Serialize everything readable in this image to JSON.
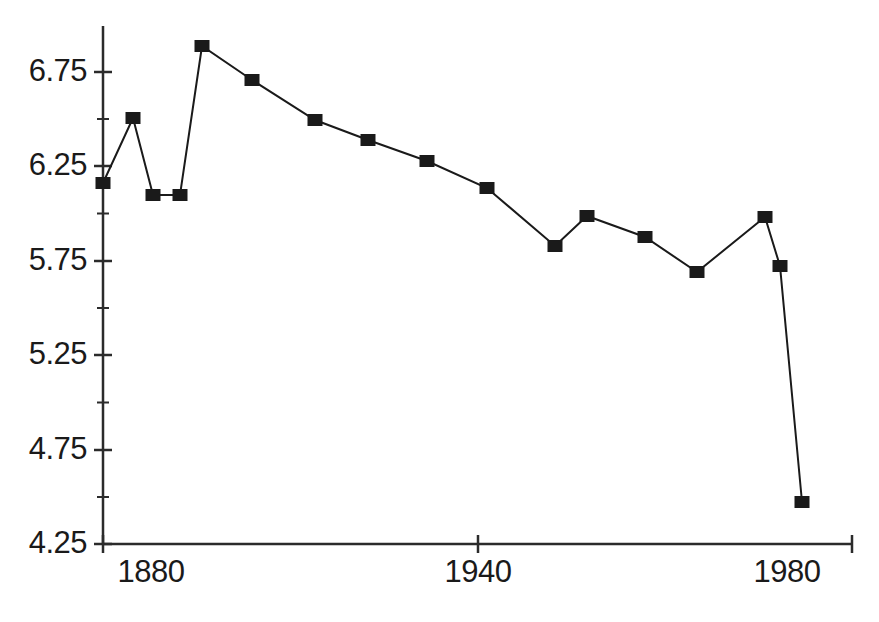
{
  "chart_data": {
    "type": "line",
    "title": "",
    "subtitle": "",
    "xlabel": "",
    "ylabel": "",
    "grid": false,
    "legend": null,
    "marker": "filled-square",
    "line_color": "#1a1a1a",
    "marker_color": "#1a1a1a",
    "background": "#ffffff",
    "xlim": [
      1872,
      1985
    ],
    "ylim": [
      4.25,
      6.95
    ],
    "y_ticks_major": [
      4.25,
      4.75,
      5.25,
      5.75,
      6.25,
      6.75
    ],
    "y_ticks_minor": [
      4.5,
      5.0,
      5.5,
      6.0,
      6.5
    ],
    "y_tick_labels": [
      "4.25",
      "4.75",
      "5.25",
      "5.75",
      "6.25",
      "6.75"
    ],
    "x_tick_labels": [
      "1880",
      "1940",
      "1980"
    ],
    "x_ticks_major": [
      1940,
      1982
    ],
    "x": [
      1873,
      1879,
      1884,
      1889,
      1894,
      1902,
      1911,
      1919,
      1927,
      1934,
      1944,
      1950,
      1957,
      1964,
      1973,
      1976,
      1979
    ],
    "values": [
      6.16,
      6.5,
      6.1,
      6.1,
      6.89,
      6.71,
      6.49,
      6.39,
      6.28,
      6.14,
      5.83,
      5.99,
      5.88,
      5.69,
      5.98,
      5.72,
      4.47
    ],
    "series": [
      {
        "name": "series-1",
        "values": [
          6.16,
          6.5,
          6.1,
          6.1,
          6.89,
          6.71,
          6.49,
          6.39,
          6.28,
          6.14,
          5.83,
          5.99,
          5.88,
          5.69,
          5.98,
          5.72,
          4.47
        ]
      }
    ],
    "points_px": [
      {
        "x": 103,
        "y": 183
      },
      {
        "x": 133,
        "y": 118
      },
      {
        "x": 153,
        "y": 195
      },
      {
        "x": 180,
        "y": 195
      },
      {
        "x": 202,
        "y": 46
      },
      {
        "x": 252,
        "y": 80
      },
      {
        "x": 315,
        "y": 120
      },
      {
        "x": 368,
        "y": 140
      },
      {
        "x": 427,
        "y": 161
      },
      {
        "x": 487,
        "y": 188
      },
      {
        "x": 555,
        "y": 246
      },
      {
        "x": 587,
        "y": 216
      },
      {
        "x": 645,
        "y": 237
      },
      {
        "x": 697,
        "y": 272
      },
      {
        "x": 765,
        "y": 217
      },
      {
        "x": 780,
        "y": 266
      },
      {
        "x": 802,
        "y": 502
      }
    ]
  },
  "axes": {
    "y_axis": {
      "labels": [
        {
          "text": "6.75",
          "y_px": 72
        },
        {
          "text": "6.25",
          "y_px": 166
        },
        {
          "text": "5.75",
          "y_px": 261
        },
        {
          "text": "5.25",
          "y_px": 355
        },
        {
          "text": "4.75",
          "y_px": 450
        },
        {
          "text": "4.25",
          "y_px": 544
        }
      ]
    },
    "x_axis": {
      "labels": [
        {
          "text": "1880",
          "x_px": 151
        },
        {
          "text": "1940",
          "x_px": 478
        },
        {
          "text": "1980",
          "x_px": 787
        }
      ]
    }
  }
}
